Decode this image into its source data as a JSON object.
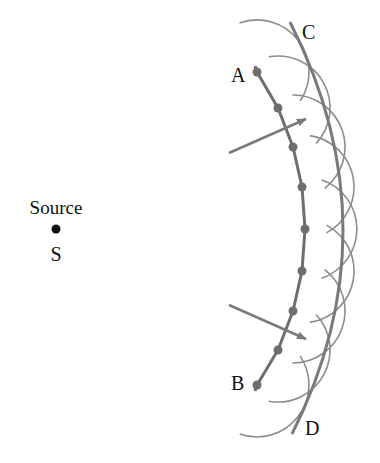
{
  "diagram": {
    "colors": {
      "wave": "#7a7a7a",
      "wavelet": "#8c8c8c",
      "source": "#111111",
      "text": "#111111",
      "background": "#ffffff"
    },
    "source": {
      "label": "Source",
      "symbol": "S",
      "x": 56,
      "y": 229
    },
    "wavefront_AB": {
      "start_label": "A",
      "end_label": "B",
      "points": [
        [
          255,
          66
        ],
        [
          257,
          72
        ],
        [
          278,
          108
        ],
        [
          293,
          147
        ],
        [
          302,
          187
        ],
        [
          305,
          229
        ],
        [
          302,
          271
        ],
        [
          293,
          311
        ],
        [
          278,
          350
        ],
        [
          257,
          385
        ],
        [
          255,
          391
        ]
      ]
    },
    "secondary_sources": [
      {
        "x": 257,
        "y": 72
      },
      {
        "x": 278,
        "y": 108
      },
      {
        "x": 293,
        "y": 147
      },
      {
        "x": 302,
        "y": 187
      },
      {
        "x": 305,
        "y": 229
      },
      {
        "x": 302,
        "y": 271
      },
      {
        "x": 293,
        "y": 311
      },
      {
        "x": 278,
        "y": 350
      },
      {
        "x": 257,
        "y": 385
      }
    ],
    "wavelet_radius": 52,
    "wavefront_CD": {
      "start_label": "C",
      "end_label": "D"
    },
    "rays": [
      {
        "from": [
          229,
          153
        ],
        "to": [
          306,
          119
        ]
      },
      {
        "from": [
          229,
          305
        ],
        "to": [
          306,
          339
        ]
      }
    ],
    "labels": [
      {
        "id": "A",
        "text": "A",
        "x": 231,
        "y": 82
      },
      {
        "id": "B",
        "text": "B",
        "x": 231,
        "y": 390
      },
      {
        "id": "C",
        "text": "C",
        "x": 302,
        "y": 39
      },
      {
        "id": "D",
        "text": "D",
        "x": 305,
        "y": 435
      },
      {
        "id": "source-label",
        "text": "Source",
        "x": 56,
        "y": 214
      },
      {
        "id": "S",
        "text": "S",
        "x": 56,
        "y": 261
      }
    ]
  }
}
